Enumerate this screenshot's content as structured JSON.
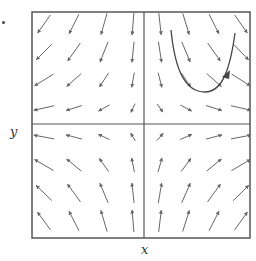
{
  "figure": {
    "type": "vector-field-with-trajectory",
    "x_label": "x",
    "y_label": "y",
    "frame": {
      "left": 32,
      "top": 12,
      "right": 250,
      "bottom": 238
    },
    "axes_origin": {
      "x": 144,
      "y": 124
    },
    "line_color": "#555555",
    "arrow_color": "#666666",
    "grid": {
      "columns_x": [
        44,
        74,
        104,
        133,
        160,
        186,
        214,
        241
      ],
      "rows_y": [
        24,
        52,
        80,
        108,
        137,
        165,
        193,
        221
      ]
    },
    "trajectory": {
      "path": "M 171 30 C 175 70, 185 92, 205 92 C 222 92, 230 70, 235 33",
      "arrowhead_at": {
        "x": 226,
        "y": 76
      },
      "direction": "up-right"
    }
  }
}
